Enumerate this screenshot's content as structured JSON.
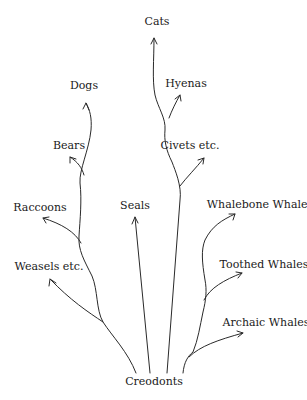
{
  "diagram": {
    "type": "phylogenetic-tree",
    "root": {
      "label": "Creodonts",
      "x": 154,
      "y": 384
    },
    "colors": {
      "line": "#2a2a2a",
      "text": "#1a1a1a",
      "background": "#ffffff"
    },
    "taxa": [
      {
        "id": "cats",
        "label": "Cats",
        "x": 157,
        "y": 25
      },
      {
        "id": "hyenas",
        "label": "Hyenas",
        "x": 186,
        "y": 87
      },
      {
        "id": "dogs",
        "label": "Dogs",
        "x": 84,
        "y": 89
      },
      {
        "id": "bears",
        "label": "Bears",
        "x": 69,
        "y": 149
      },
      {
        "id": "civets",
        "label": "Civets etc.",
        "x": 190,
        "y": 149
      },
      {
        "id": "seals",
        "label": "Seals",
        "x": 135,
        "y": 209
      },
      {
        "id": "whalebone",
        "label": "Whalebone Whales",
        "x": 260,
        "y": 208
      },
      {
        "id": "raccoons",
        "label": "Raccoons",
        "x": 40,
        "y": 211
      },
      {
        "id": "toothed",
        "label": "Toothed Whales",
        "x": 264,
        "y": 268
      },
      {
        "id": "weasels",
        "label": "Weasels etc.",
        "x": 49,
        "y": 270
      },
      {
        "id": "archaic",
        "label": "Archaic Whales",
        "x": 266,
        "y": 326
      }
    ],
    "edges": [
      {
        "from": "Creodonts",
        "to": "Weasels etc."
      },
      {
        "from": "Creodonts",
        "to": "Raccoons"
      },
      {
        "from": "Creodonts",
        "to": "Bears"
      },
      {
        "from": "Creodonts",
        "to": "Dogs"
      },
      {
        "from": "Creodonts",
        "to": "Seals"
      },
      {
        "from": "Creodonts",
        "to": "Civets etc."
      },
      {
        "from": "Creodonts",
        "to": "Hyenas"
      },
      {
        "from": "Creodonts",
        "to": "Cats"
      },
      {
        "from": "Creodonts",
        "to": "Archaic Whales"
      },
      {
        "from": "Creodonts",
        "to": "Toothed Whales"
      },
      {
        "from": "Creodonts",
        "to": "Whalebone Whales"
      }
    ]
  }
}
